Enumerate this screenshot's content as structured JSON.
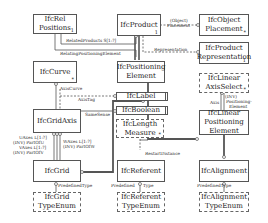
{
  "diagram": {
    "entities": [
      {
        "id": "rel_positions",
        "label": "IfcRel\nPositions",
        "line1": "IfcRel",
        "line2": "Positions",
        "marker": "1",
        "style": "solid"
      },
      {
        "id": "product",
        "label": "IfcProduct",
        "marker": "1",
        "style": "solid"
      },
      {
        "id": "object_placement",
        "line1": "IfcObject",
        "line2": "Placement",
        "marker": "*",
        "style": "solid"
      },
      {
        "id": "product_representation",
        "line1": "IfcProduct",
        "line2": "Representation",
        "marker": "1",
        "style": "solid"
      },
      {
        "id": "curve",
        "label": "IfcCurve",
        "marker": "*",
        "style": "solid"
      },
      {
        "id": "positioning_element",
        "line1": "IfcPositioning",
        "line2": "Element",
        "style": "solid"
      },
      {
        "id": "linear_axis_select",
        "line1": "IfcLinear",
        "line2": "AxisSelect",
        "marker": "*",
        "style": "dashed"
      },
      {
        "id": "label",
        "label": "IfcLabel",
        "style": "double"
      },
      {
        "id": "boolean",
        "label": "IfcBoolean",
        "style": "double"
      },
      {
        "id": "length_measure",
        "line1": "IfcLength",
        "line2": "Measure",
        "marker": "*",
        "style": "dashed"
      },
      {
        "id": "grid_axis",
        "label": "IfcGridAxis",
        "style": "solid"
      },
      {
        "id": "linear_positioning_element",
        "line1": "IfcLinear",
        "line2": "Positioning",
        "line3": "Element",
        "style": "solid"
      },
      {
        "id": "grid",
        "label": "IfcGrid",
        "style": "solid"
      },
      {
        "id": "referent",
        "label": "IfcReferent",
        "style": "solid"
      },
      {
        "id": "alignment",
        "label": "IfcAlignment",
        "style": "solid"
      },
      {
        "id": "grid_type_enum",
        "line1": "IfcGrid",
        "line2": "TypeEnum",
        "style": "dashed"
      },
      {
        "id": "referent_type_enum",
        "line1": "IfcReferent",
        "line2": "TypeEnum",
        "style": "dashed"
      },
      {
        "id": "alignment_type_enum",
        "line1": "IfcAlignment",
        "line2": "TypeEnum",
        "style": "dashed"
      }
    ],
    "relations": {
      "object_placement": "(Object)\nPlacement",
      "object_placement_l1": "(Object)",
      "object_placement_l2": "Placement",
      "representation": "Representation",
      "related_products": "RelatedProducts S[1:?]",
      "relating_positioning_element": "RelatingPositioningElement",
      "axis_curve": "AxisCurve",
      "axis_tag": "AxisTag",
      "same_sense": "SameSense",
      "u_axes_l1": "UAxes L[1:?]",
      "u_axes_l2": "(INV) PartOfU",
      "v_axes_l1": "VAxes L[1:?]",
      "v_axes_l2": "(INV) PartOfV",
      "w_axes_l1": "WAxes L[1:?]",
      "w_axes_l2": "(INV) PartOfW",
      "axis": "Axis",
      "inv": "(INV)",
      "positioning_element_l1": "Positioning-",
      "positioning_element_l2": "Element",
      "restart_distance": "RestartDistance",
      "grid_predefined_type": "PredefinedType",
      "referent_predefined": "Predefined",
      "referent_type": "Type",
      "alignment_predefined_type": "PredefinedType"
    }
  }
}
